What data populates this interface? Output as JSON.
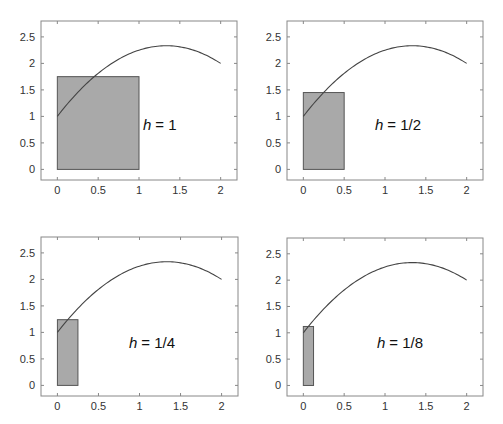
{
  "chart_data": [
    {
      "type": "line",
      "title": "",
      "annotation": "h = 1",
      "h_symbol": "h",
      "h_value": "= 1",
      "curve": {
        "formula": "f(x) = 1 + 2x - 0.75x^2",
        "x_range": [
          0,
          2
        ]
      },
      "rectangle": {
        "x0": 0,
        "x1": 1,
        "height": 1.75
      },
      "xlim": [
        -0.2,
        2.2
      ],
      "ylim": [
        -0.2,
        2.8
      ],
      "xticks": [
        "0",
        "0.5",
        "1",
        "1.5",
        "2"
      ],
      "yticks": [
        "0",
        "0.5",
        "1",
        "1.5",
        "2",
        "2.5"
      ],
      "xlabel": "",
      "ylabel": "",
      "grid": false
    },
    {
      "type": "line",
      "title": "",
      "annotation": "h = 1/2",
      "h_symbol": "h",
      "h_value": "= 1/2",
      "curve": {
        "formula": "f(x) = 1 + 2x - 0.75x^2",
        "x_range": [
          0,
          2
        ]
      },
      "rectangle": {
        "x0": 0,
        "x1": 0.5,
        "height": 1.45
      },
      "xlim": [
        -0.2,
        2.2
      ],
      "ylim": [
        -0.2,
        2.8
      ],
      "xticks": [
        "0",
        "0.5",
        "1",
        "1.5",
        "2"
      ],
      "yticks": [
        "0",
        "0.5",
        "1",
        "1.5",
        "2",
        "2.5"
      ],
      "xlabel": "",
      "ylabel": "",
      "grid": false
    },
    {
      "type": "line",
      "title": "",
      "annotation": "h = 1/4",
      "h_symbol": "h",
      "h_value": "= 1/4",
      "curve": {
        "formula": "f(x) = 1 + 2x - 0.75x^2",
        "x_range": [
          0,
          2
        ]
      },
      "rectangle": {
        "x0": 0,
        "x1": 0.25,
        "height": 1.24
      },
      "xlim": [
        -0.2,
        2.2
      ],
      "ylim": [
        -0.2,
        2.8
      ],
      "xticks": [
        "0",
        "0.5",
        "1",
        "1.5",
        "2"
      ],
      "yticks": [
        "0",
        "0.5",
        "1",
        "1.5",
        "2",
        "2.5"
      ],
      "xlabel": "",
      "ylabel": "",
      "grid": false
    },
    {
      "type": "line",
      "title": "",
      "annotation": "h = 1/8",
      "h_symbol": "h",
      "h_value": "= 1/8",
      "curve": {
        "formula": "f(x) = 1 + 2x - 0.75x^2",
        "x_range": [
          0,
          2
        ]
      },
      "rectangle": {
        "x0": 0,
        "x1": 0.125,
        "height": 1.12
      },
      "xlim": [
        -0.2,
        2.2
      ],
      "ylim": [
        -0.2,
        2.8
      ],
      "xticks": [
        "0",
        "0.5",
        "1",
        "1.5",
        "2"
      ],
      "yticks": [
        "0",
        "0.5",
        "1",
        "1.5",
        "2",
        "2.5"
      ],
      "xlabel": "",
      "ylabel": "",
      "grid": false
    }
  ],
  "panels": [
    {
      "h_symbol": "h",
      "h_value": "= 1"
    },
    {
      "h_symbol": "h",
      "h_value": "= 1/2"
    },
    {
      "h_symbol": "h",
      "h_value": "= 1/4"
    },
    {
      "h_symbol": "h",
      "h_value": "= 1/8"
    }
  ],
  "colors": {
    "rect_fill": "#a9a9a9",
    "rect_stroke": "#555555",
    "curve": "#444444",
    "frame": "#888888"
  }
}
